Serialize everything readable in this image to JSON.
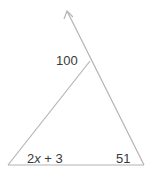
{
  "diagram": {
    "type": "triangle-exterior-angle",
    "line_color": "#b4b4b4",
    "text_color": "#3a3a3a",
    "labels": {
      "exterior_angle": "100",
      "left_angle_prefix": "2",
      "left_angle_var": "x",
      "left_angle_suffix": " + 3",
      "right_angle": "51"
    }
  }
}
